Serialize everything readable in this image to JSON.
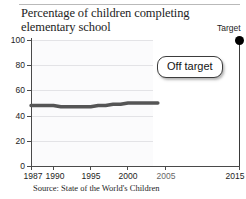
{
  "chart_data": {
    "type": "line",
    "title": "Percentage of children completing elementary school",
    "xlabel": "",
    "ylabel": "",
    "ylim": [
      0,
      100
    ],
    "xlim": [
      1987,
      2015
    ],
    "grid": true,
    "legend": null,
    "yticks": [
      0,
      20,
      40,
      60,
      80,
      100
    ],
    "ytick_labels": [
      "0",
      "20",
      "40",
      "60",
      "80",
      "100"
    ],
    "xticks": [
      1987,
      1990,
      1995,
      2000,
      2005,
      2015
    ],
    "xtick_labels": [
      "1987",
      "1990",
      "1995",
      "2000",
      "2005",
      "2015"
    ],
    "series": [
      {
        "name": "Children completing elementary school",
        "color": "#555555",
        "x": [
          1987,
          1988,
          1989,
          1990,
          1991,
          1992,
          1993,
          1994,
          1995,
          1996,
          1997,
          1998,
          1999,
          2000,
          2001,
          2002,
          2003,
          2004
        ],
        "values": [
          48,
          48,
          48,
          48,
          47,
          47,
          47,
          47,
          47,
          48,
          48,
          49,
          49,
          50,
          50,
          50,
          50,
          50
        ]
      }
    ],
    "annotations": [
      {
        "name": "target-point",
        "label": "Target",
        "x": 2015,
        "y": 100,
        "marker": "filled-circle",
        "color": "#000000"
      },
      {
        "name": "status-callout",
        "label": "Off target"
      }
    ],
    "source": "Source: State of the World's Children"
  },
  "figure": {
    "title_line1": "Percentage of children completing",
    "title_line2": "elementary school",
    "source": "Source: State of the World's Children",
    "target_label": "Target",
    "callout_label": "Off target",
    "y_labels": [
      "100",
      "80",
      "60",
      "40",
      "20",
      "0"
    ],
    "x_labels": [
      "1987",
      "1990",
      "1995",
      "2000",
      "2005",
      "2015"
    ]
  }
}
